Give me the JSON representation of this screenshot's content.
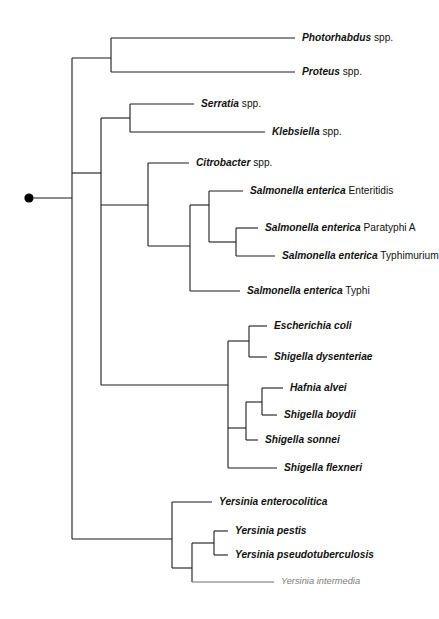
{
  "figure": {
    "type": "cladogram",
    "root_marker": "filled-circle",
    "background_color": "#ffffff",
    "line_color": "#1a1a1a",
    "faint_line_color": "#6e6e6e"
  },
  "leaves": [
    {
      "id": "photorhabdus",
      "genus": "Photorhabdus",
      "epithet": " spp.",
      "style": "normal",
      "tip_x": 295,
      "label_x": 302,
      "y": 38
    },
    {
      "id": "proteus",
      "genus": "Proteus",
      "epithet": " spp.",
      "style": "normal",
      "tip_x": 295,
      "label_x": 302,
      "y": 72
    },
    {
      "id": "serratia",
      "genus": "Serratia",
      "epithet": " spp.",
      "style": "normal",
      "tip_x": 194,
      "label_x": 201,
      "y": 104
    },
    {
      "id": "klebsiella",
      "genus": "Klebsiella",
      "epithet": " spp.",
      "style": "normal",
      "tip_x": 265,
      "label_x": 272,
      "y": 132
    },
    {
      "id": "citrobacter",
      "genus": "Citrobacter",
      "epithet": " spp.",
      "style": "normal",
      "tip_x": 189,
      "label_x": 196,
      "y": 163
    },
    {
      "id": "s-enteritidis",
      "genus": "Salmonella enterica",
      "epithet": " Enteritidis",
      "style": "normal",
      "tip_x": 243,
      "label_x": 250,
      "y": 191
    },
    {
      "id": "s-paratyphi-a",
      "genus": "Salmonella enterica",
      "epithet": " Paratyphi A",
      "style": "normal",
      "tip_x": 258,
      "label_x": 265,
      "y": 228
    },
    {
      "id": "s-typhimurium",
      "genus": "Salmonella enterica",
      "epithet": " Typhimurium",
      "style": "normal",
      "tip_x": 275,
      "label_x": 282,
      "y": 256
    },
    {
      "id": "s-typhi",
      "genus": "Salmonella enterica",
      "epithet": " Typhi",
      "style": "normal",
      "tip_x": 240,
      "label_x": 247,
      "y": 291
    },
    {
      "id": "e-coli",
      "genus": "Escherichia coli",
      "epithet": "",
      "style": "normal",
      "tip_x": 267,
      "label_x": 274,
      "y": 326
    },
    {
      "id": "s-dysenteriae",
      "genus": "Shigella dysenteriae",
      "epithet": "",
      "style": "normal",
      "tip_x": 267,
      "label_x": 274,
      "y": 357
    },
    {
      "id": "h-alvei",
      "genus": "Hafnia alvei",
      "epithet": "",
      "style": "normal",
      "tip_x": 283,
      "label_x": 290,
      "y": 388
    },
    {
      "id": "s-boydii",
      "genus": "Shigella boydii",
      "epithet": "",
      "style": "normal",
      "tip_x": 277,
      "label_x": 284,
      "y": 415
    },
    {
      "id": "s-sonnei",
      "genus": "Shigella sonnei",
      "epithet": "",
      "style": "normal",
      "tip_x": 258,
      "label_x": 265,
      "y": 440
    },
    {
      "id": "s-flexneri",
      "genus": "Shigella flexneri",
      "epithet": "",
      "style": "normal",
      "tip_x": 277,
      "label_x": 284,
      "y": 468
    },
    {
      "id": "y-enterocolitica",
      "genus": "Yersinia enterocolitica",
      "epithet": "",
      "style": "normal",
      "tip_x": 212,
      "label_x": 219,
      "y": 502
    },
    {
      "id": "y-pestis",
      "genus": "Yersinia pestis",
      "epithet": "",
      "style": "normal",
      "tip_x": 228,
      "label_x": 235,
      "y": 531
    },
    {
      "id": "y-pseudotuberculosis",
      "genus": "Yersinia pseudotuberculosis",
      "epithet": "",
      "style": "normal",
      "tip_x": 228,
      "label_x": 235,
      "y": 555
    },
    {
      "id": "y-intermedia",
      "genus": "Yersinia intermedia",
      "epithet": "",
      "style": "faint",
      "tip_x": 274,
      "label_x": 281,
      "y": 582
    }
  ],
  "root": {
    "dot_x": 29,
    "dot_y": 198,
    "dot_radius": 5,
    "stem_x_start": 34,
    "stem_x_end": 72,
    "stem_y": 198,
    "spine_x": 72,
    "spine_y_top": 58,
    "spine_y_bottom": 539
  },
  "nodes": [
    {
      "id": "n-photorhabdus-proteus",
      "x": 111,
      "y_top": 38,
      "y_bottom": 72,
      "parent_x": 72,
      "parent_y": 58
    },
    {
      "id": "n-serratia-klebsiella",
      "x": 130,
      "y_top": 104,
      "y_bottom": 132,
      "parent_x": 101,
      "parent_y": 118
    },
    {
      "id": "n-enterics-upper",
      "x": 101,
      "y_top": 118,
      "y_bottom": 228,
      "parent_x": 72,
      "parent_y": 173
    },
    {
      "id": "n-citro-salmo",
      "x": 148,
      "y_top": 163,
      "y_bottom": 246,
      "parent_x": 101,
      "parent_y": 205
    },
    {
      "id": "n-salmonella-all",
      "x": 190,
      "y_top": 205,
      "y_bottom": 291,
      "parent_x": 148,
      "parent_y": 246
    },
    {
      "id": "n-salmonella-3",
      "x": 209,
      "y_top": 191,
      "y_bottom": 242,
      "parent_x": 190,
      "parent_y": 205
    },
    {
      "id": "n-para-typhim",
      "x": 236,
      "y_top": 228,
      "y_bottom": 256,
      "parent_x": 209,
      "parent_y": 242
    },
    {
      "id": "n-coli-shigella",
      "x": 228,
      "y_top": 341,
      "y_bottom": 428,
      "parent_x": 160,
      "parent_y": 385
    },
    {
      "id": "n-coli-dys",
      "x": 249,
      "y_top": 326,
      "y_bottom": 357,
      "parent_x": 228,
      "parent_y": 341
    },
    {
      "id": "n-hafnia-clade",
      "x": 246,
      "y_top": 402,
      "y_bottom": 440,
      "parent_x": 228,
      "parent_y": 428
    },
    {
      "id": "n-hafnia-boydii",
      "x": 262,
      "y_top": 388,
      "y_bottom": 415,
      "parent_x": 246,
      "parent_y": 402
    },
    {
      "id": "n-sonnei-flexneri",
      "x": 228,
      "y_top": 440,
      "y_bottom": 468,
      "parent_x": 228,
      "parent_y": 440
    },
    {
      "id": "n-yersinia-all",
      "x": 172,
      "y_top": 502,
      "y_bottom": 568,
      "parent_x": 72,
      "parent_y": 539
    },
    {
      "id": "n-yersinia-3",
      "x": 192,
      "y_top": 543,
      "y_bottom": 582,
      "parent_x": 172,
      "parent_y": 568
    },
    {
      "id": "n-pestis-pseudo",
      "x": 214,
      "y_top": 531,
      "y_bottom": 555,
      "parent_x": 192,
      "parent_y": 543
    },
    {
      "id": "n-lower-enterics",
      "x": 160,
      "y_top": 385,
      "y_bottom": 385,
      "parent_x": 101,
      "parent_y": 385
    }
  ]
}
